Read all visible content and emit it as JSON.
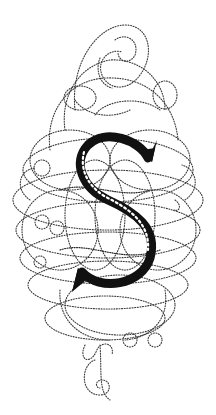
{
  "artwork": {
    "letter": "S",
    "description": "Ornamental calligraphic initial",
    "colors": {
      "background": "#ffffff",
      "ink": "#111111",
      "flourish": "#3a3a3a",
      "ornament": "#ffffff"
    },
    "elements": {
      "initial_letter": "S",
      "letter_decoration": "star-pattern band",
      "flourish_style": "dotted loops and spirals"
    }
  }
}
